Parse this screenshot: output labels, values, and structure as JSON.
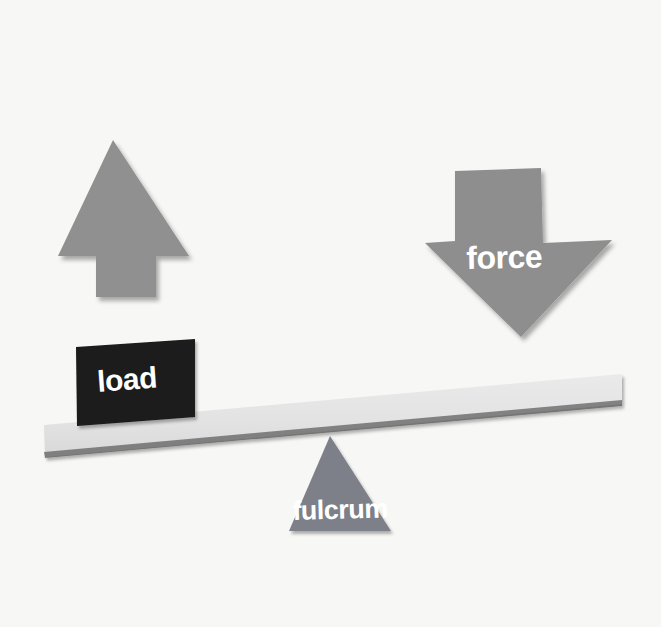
{
  "diagram": {
    "background_color": "#f7f7f5",
    "elements": {
      "load_block": {
        "label": "load",
        "color": "#1a1a1a",
        "text_color": "#ffffff",
        "icon": "square-block-icon"
      },
      "force_arrow": {
        "label": "force",
        "color": "#8e8e8e",
        "text_color": "#ffffff",
        "icon": "arrow-down-icon",
        "direction": "down"
      },
      "effort_arrow": {
        "label": "",
        "color": "#909090",
        "icon": "arrow-up-icon",
        "direction": "up"
      },
      "fulcrum": {
        "label": "fulcrum",
        "color": "#7d8088",
        "text_color": "#ffffff",
        "icon": "triangle-icon"
      },
      "beam": {
        "label": "",
        "color": "#e3e3e3",
        "edge_color": "#5b5b5b",
        "icon": "plank-icon",
        "tilt_degrees": -4.5
      }
    }
  }
}
